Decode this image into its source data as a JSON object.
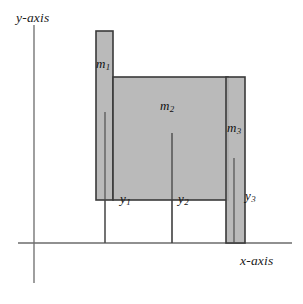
{
  "figure": {
    "type": "diagram",
    "background_color": "#ffffff",
    "bar_fill_color": "#b5b5b5",
    "bar_stroke_color": "#3a3a3a",
    "axis_color": "#6b6b6b",
    "text_color": "#111111"
  },
  "axes": {
    "y_axis_label": "y-axis",
    "x_axis_label": "x-axis",
    "y_axis_x": 34,
    "y_axis_top": 25,
    "y_axis_bottom": 283,
    "x_axis_y": 243,
    "x_axis_left": 18,
    "x_axis_right": 292
  },
  "bars": [
    {
      "name": "m1",
      "label": "m",
      "subscript": "1",
      "x": 96,
      "y": 31,
      "width": 17,
      "height": 169,
      "centroid_line_x": 105,
      "centroid_line_top": 112,
      "centroid_line_bottom": 243,
      "mass_label_x": 96,
      "mass_label_y": 56,
      "y_label": "y",
      "y_subscript": "1",
      "y_label_x": 120,
      "y_label_y": 191
    },
    {
      "name": "m2",
      "label": "m",
      "subscript": "2",
      "x": 113,
      "y": 77,
      "width": 115,
      "height": 123,
      "centroid_line_x": 172,
      "centroid_line_top": 133,
      "centroid_line_bottom": 243,
      "mass_label_x": 160,
      "mass_label_y": 98,
      "y_label": "y",
      "y_subscript": "2",
      "y_label_x": 178,
      "y_label_y": 191
    },
    {
      "name": "m3",
      "label": "m",
      "subscript": "3",
      "x": 226,
      "y": 77,
      "width": 19,
      "height": 166,
      "centroid_line_x": 234,
      "centroid_line_top": 158,
      "centroid_line_bottom": 243,
      "mass_label_x": 227,
      "mass_label_y": 120,
      "y_label": "y",
      "y_subscript": "3",
      "y_label_x": 245,
      "y_label_y": 188
    }
  ]
}
